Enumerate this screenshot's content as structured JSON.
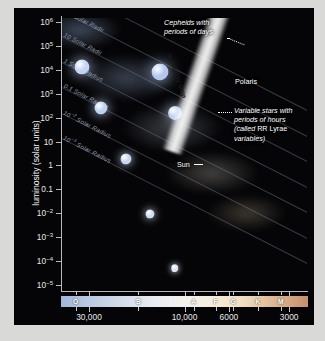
{
  "chart_data": {
    "type": "scatter",
    "xlabel": "surface temperature (K)",
    "ylabel": "luminosity (solar units)",
    "xlim": [
      40000,
      2500
    ],
    "ylim": [
      1e-05,
      1000000.0
    ],
    "x_scale": "log-reversed",
    "y_scale": "log",
    "grid": false,
    "legend": "none",
    "y_ticks": [
      {
        "label": "10",
        "sup": "6",
        "value": 1000000
      },
      {
        "label": "10",
        "sup": "5",
        "value": 100000
      },
      {
        "label": "10",
        "sup": "4",
        "value": 10000
      },
      {
        "label": "10",
        "sup": "3",
        "value": 1000
      },
      {
        "label": "10",
        "sup": "2",
        "value": 100
      },
      {
        "label": "10",
        "sup": "",
        "value": 10
      },
      {
        "label": "1",
        "sup": "",
        "value": 1
      },
      {
        "label": "0.1",
        "sup": "",
        "value": 0.1
      },
      {
        "label": "10",
        "sup": "−2",
        "value": 0.01
      },
      {
        "label": "10",
        "sup": "−3",
        "value": 0.001
      },
      {
        "label": "10",
        "sup": "−4",
        "value": 0.0001
      },
      {
        "label": "10",
        "sup": "−5",
        "value": 1e-05
      }
    ],
    "x_ticks": [
      {
        "label": "30,000",
        "value": 30000
      },
      {
        "label": "10,000",
        "value": 10000
      },
      {
        "label": "6000",
        "value": 6000
      },
      {
        "label": "3000",
        "value": 3000
      }
    ],
    "spectral_classes": [
      {
        "label": "O",
        "value": 35000
      },
      {
        "label": "B",
        "value": 17000
      },
      {
        "label": "A",
        "value": 9000
      },
      {
        "label": "F",
        "value": 7000
      },
      {
        "label": "G",
        "value": 5700
      },
      {
        "label": "K",
        "value": 4300
      },
      {
        "label": "M",
        "value": 3300
      }
    ],
    "radius_lines": [
      {
        "label": "10",
        "sup": "3",
        "unit": " Solar Radii",
        "value": 1000
      },
      {
        "label": "10",
        "sup": "2",
        "unit": " Solar Radii",
        "value": 100
      },
      {
        "label": "10",
        "sup": "",
        "unit": " Solar Radii",
        "value": 10
      },
      {
        "label": "1",
        "sup": "",
        "unit": " Solar Radius",
        "value": 1
      },
      {
        "label": "0.1",
        "sup": "",
        "unit": " Solar Radius",
        "value": 0.1
      },
      {
        "label": "10",
        "sup": "−2",
        "unit": " Solar Radius",
        "value": 0.01
      },
      {
        "label": "10",
        "sup": "−3",
        "unit": " Solar Radius",
        "value": 0.001
      }
    ],
    "annotations": [
      {
        "name": "cepheids",
        "line1": "Cepheids with",
        "line2": "periods of days"
      },
      {
        "name": "instability-strip",
        "text": "Instability strip"
      },
      {
        "name": "polaris",
        "text": "Polaris"
      },
      {
        "name": "rr-lyrae",
        "line1": "Variable stars with",
        "line2": "periods of hours",
        "line3a": "(called ",
        "line3b": "RR Lyrae",
        "line4": "variables)"
      },
      {
        "name": "sun",
        "text": "Sun"
      }
    ],
    "colors": {
      "background": "#050507",
      "margin": "#d9d9d7",
      "axis": "#b9b9bb",
      "text": "#e8e8e8",
      "radius_line": "#78829660",
      "hot_star": "#b9ccf0",
      "cool_star": "#f0c08a",
      "instability_strip": "#ffffff"
    },
    "main_sequence_stars": [
      {
        "xp": 8,
        "yp": 18,
        "d": 15,
        "c": "#c3d4f4"
      },
      {
        "xp": 16,
        "yp": 33,
        "d": 13,
        "c": "#c0d2f2"
      },
      {
        "xp": 26,
        "yp": 52,
        "d": 11,
        "c": "#c8d6f0"
      },
      {
        "xp": 36,
        "yp": 72,
        "d": 9,
        "c": "#d2dcf0"
      },
      {
        "xp": 46,
        "yp": 92,
        "d": 7.5,
        "c": "#dde3f0"
      },
      {
        "xp": 54,
        "yp": 108,
        "d": 6.5,
        "c": "#e8eaf0"
      },
      {
        "xp": 61,
        "yp": 123,
        "d": 5.5,
        "c": "#f0eee8"
      },
      {
        "xp": 67,
        "yp": 136,
        "d": 5,
        "c": "#f4ede0"
      },
      {
        "xp": 73,
        "yp": 150,
        "d": 4.5,
        "c": "#f6ecd8"
      },
      {
        "xp": 78,
        "yp": 162,
        "d": 4,
        "c": "#f6e8cc"
      },
      {
        "xp": 82,
        "yp": 173,
        "d": 3.6,
        "c": "#f4e0bc"
      },
      {
        "xp": 86,
        "yp": 184,
        "d": 3.2,
        "c": "#f2d8ae"
      },
      {
        "xp": 89,
        "yp": 194,
        "d": 2.9,
        "c": "#f0d0a2"
      },
      {
        "xp": 91,
        "yp": 204,
        "d": 2.6,
        "c": "#eec898"
      },
      {
        "xp": 93,
        "yp": 214,
        "d": 2.3,
        "c": "#ecc08e"
      },
      {
        "xp": 95,
        "yp": 224,
        "d": 2.1,
        "c": "#eab888"
      },
      {
        "xp": 96,
        "yp": 234,
        "d": 1.9,
        "c": "#e8b080"
      }
    ],
    "giant_stars": [
      {
        "xp": 40,
        "yp": 20,
        "d": 17,
        "c": "#b4c8ee"
      },
      {
        "xp": 46,
        "yp": 35,
        "d": 14,
        "c": "#bcd0ee"
      }
    ],
    "white_dwarf_stars": [
      {
        "xp": 86,
        "yp": 215,
        "d": 2.4,
        "c": "#ffffff"
      },
      {
        "xp": 89,
        "yp": 222,
        "d": 2.2,
        "c": "#f2f4ff"
      },
      {
        "xp": 92,
        "yp": 228,
        "d": 2.0,
        "c": "#e8ecfa"
      }
    ]
  }
}
